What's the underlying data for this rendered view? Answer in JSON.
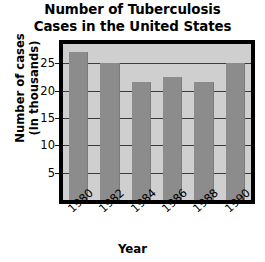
{
  "chart_data": {
    "type": "bar",
    "title": "Number of Tuberculosis Cases in the United States",
    "title_lines": [
      "Number of Tuberculosis",
      "Cases in the United States"
    ],
    "categories": [
      "1980",
      "1982",
      "1984",
      "1986",
      "1988",
      "1990"
    ],
    "values": [
      27,
      25,
      21.5,
      22.5,
      21.5,
      25
    ],
    "xlabel": "Year",
    "ylabel": "Number of cases (in thousands)",
    "ylabel_lines": [
      "Number of cases",
      "(in thousands)"
    ],
    "yticks": [
      5,
      10,
      15,
      20,
      25
    ],
    "ylim": [
      0,
      28.5
    ],
    "grid": true,
    "legend": "none",
    "colors": {
      "bar": "#8c8c8c",
      "plot_background": "#cfcfcf",
      "frame": "#000000",
      "gridline": "#3a3a3a",
      "text": "#000000",
      "page_background": "#ffffff"
    }
  }
}
